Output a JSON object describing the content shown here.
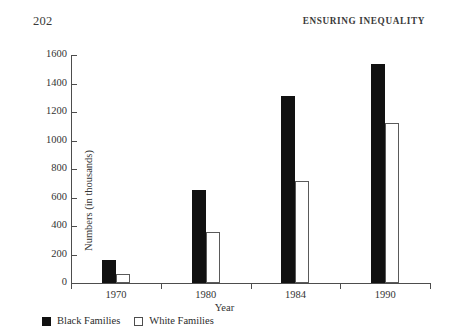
{
  "page": {
    "folio": "202",
    "running_head": "ENSURING INEQUALITY"
  },
  "chart_data": {
    "type": "bar",
    "title": "",
    "xlabel": "Year",
    "ylabel": "Numbers (in thousands)",
    "categories": [
      "1970",
      "1980",
      "1984",
      "1990"
    ],
    "series": [
      {
        "name": "Black Families",
        "color": "#111111",
        "values": [
          160,
          650,
          1310,
          1540
        ]
      },
      {
        "name": "White Families",
        "color": "#ffffff",
        "values": [
          65,
          360,
          715,
          1120
        ]
      }
    ],
    "ylim": [
      0,
      1600
    ],
    "ytick_labels": [
      "0",
      "200",
      "400",
      "600",
      "800",
      "1000",
      "1200",
      "1400",
      "1600"
    ],
    "ytick_values": [
      0,
      200,
      400,
      600,
      800,
      1000,
      1200,
      1400,
      1600
    ],
    "grid": false,
    "legend_position": "bottom-left"
  },
  "legend": {
    "items": [
      {
        "label": "Black Families",
        "style": "filled"
      },
      {
        "label": "White Families",
        "style": "hollow"
      }
    ]
  }
}
